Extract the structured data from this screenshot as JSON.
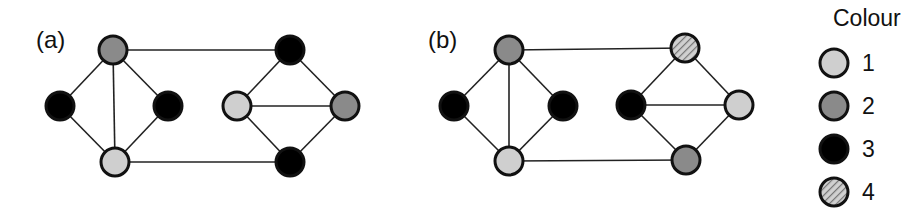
{
  "colors": {
    "1": "#cfcfcf",
    "2": "#8a8a8a",
    "3": "#000000",
    "4": "hatched"
  },
  "panels": [
    {
      "label": "(a)",
      "label_pos": [
        36,
        48
      ],
      "nodes": [
        {
          "id": "a1",
          "x": 113,
          "y": 50,
          "color": 2
        },
        {
          "id": "a2",
          "x": 60,
          "y": 106,
          "color": 3
        },
        {
          "id": "a3",
          "x": 168,
          "y": 106,
          "color": 3
        },
        {
          "id": "a4",
          "x": 115,
          "y": 162,
          "color": 1
        },
        {
          "id": "a5",
          "x": 290,
          "y": 50,
          "color": 3
        },
        {
          "id": "a6",
          "x": 237,
          "y": 106,
          "color": 1
        },
        {
          "id": "a7",
          "x": 345,
          "y": 106,
          "color": 2
        },
        {
          "id": "a8",
          "x": 290,
          "y": 162,
          "color": 3
        }
      ],
      "edges": [
        [
          "a1",
          "a2"
        ],
        [
          "a1",
          "a3"
        ],
        [
          "a1",
          "a4"
        ],
        [
          "a2",
          "a4"
        ],
        [
          "a3",
          "a4"
        ],
        [
          "a1",
          "a5"
        ],
        [
          "a4",
          "a8"
        ],
        [
          "a5",
          "a6"
        ],
        [
          "a5",
          "a7"
        ],
        [
          "a6",
          "a7"
        ],
        [
          "a6",
          "a8"
        ],
        [
          "a7",
          "a8"
        ]
      ]
    },
    {
      "label": "(b)",
      "label_pos": [
        428,
        48
      ],
      "nodes": [
        {
          "id": "b1",
          "x": 509,
          "y": 50,
          "color": 2
        },
        {
          "id": "b2",
          "x": 454,
          "y": 106,
          "color": 3
        },
        {
          "id": "b3",
          "x": 563,
          "y": 106,
          "color": 3
        },
        {
          "id": "b4",
          "x": 509,
          "y": 161,
          "color": 1
        },
        {
          "id": "b5",
          "x": 685,
          "y": 48,
          "color": 4
        },
        {
          "id": "b6",
          "x": 631,
          "y": 105,
          "color": 3
        },
        {
          "id": "b7",
          "x": 739,
          "y": 105,
          "color": 1
        },
        {
          "id": "b8",
          "x": 686,
          "y": 160,
          "color": 2
        }
      ],
      "edges": [
        [
          "b1",
          "b2"
        ],
        [
          "b1",
          "b3"
        ],
        [
          "b1",
          "b4"
        ],
        [
          "b2",
          "b4"
        ],
        [
          "b3",
          "b4"
        ],
        [
          "b1",
          "b5"
        ],
        [
          "b4",
          "b8"
        ],
        [
          "b5",
          "b6"
        ],
        [
          "b5",
          "b7"
        ],
        [
          "b6",
          "b7"
        ],
        [
          "b6",
          "b8"
        ],
        [
          "b7",
          "b8"
        ]
      ]
    }
  ],
  "legend": {
    "title": "Colour",
    "items": [
      {
        "label": "1",
        "color": 1
      },
      {
        "label": "2",
        "color": 2
      },
      {
        "label": "3",
        "color": 3
      },
      {
        "label": "4",
        "color": 4
      }
    ]
  }
}
